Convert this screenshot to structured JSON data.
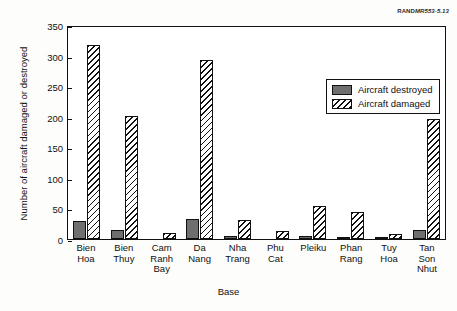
{
  "credit": {
    "org": "RAND",
    "number": "MR553-5.13"
  },
  "chart_data": {
    "type": "bar",
    "title": "",
    "xlabel": "Base",
    "ylabel": "Number of aircraft damaged or destroyed",
    "ylim": [
      0,
      350
    ],
    "yticks": [
      0,
      50,
      100,
      150,
      200,
      250,
      300,
      350
    ],
    "grid": false,
    "legend_position": "upper-right-inside",
    "categories": [
      "Bien\nHoa",
      "Bien\nThuy",
      "Cam\nRanh\nBay",
      "Da\nNang",
      "Nha\nTrang",
      "Phu\nCat",
      "Pleiku",
      "Phan\nRang",
      "Tuy\nHoa",
      "Tan\nSon\nNhut"
    ],
    "series": [
      {
        "name": "Aircraft destroyed",
        "color": "#6f6f6f",
        "pattern": "solid",
        "values": [
          30,
          14,
          0,
          33,
          5,
          0,
          5,
          4,
          2,
          14
        ]
      },
      {
        "name": "Aircraft damaged",
        "color": "#ffffff",
        "pattern": "diagonal-hatch",
        "values": [
          318,
          201,
          10,
          293,
          31,
          13,
          54,
          45,
          8,
          197
        ]
      }
    ]
  }
}
